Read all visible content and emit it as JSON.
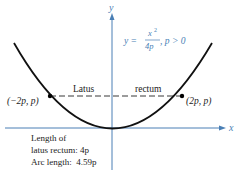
{
  "diagram": {
    "equation": {
      "lhs": "y =",
      "num": "x",
      "num_exp": "2",
      "den": "4p",
      "condition": ", p > 0"
    },
    "axes": {
      "x_label": "x",
      "y_label": "y",
      "color": "#4a7fb5"
    },
    "curve_color": "#111111",
    "points": {
      "left": "(−2p, p)",
      "right": "(2p, p)"
    },
    "latus_label_left": "Latus",
    "latus_label_right": "rectum",
    "notes": {
      "line1": "Length of",
      "line2": "latus rectum: 4p",
      "line3": "Arc length:  4.59p"
    },
    "equation_color": "#4a7fb5"
  }
}
